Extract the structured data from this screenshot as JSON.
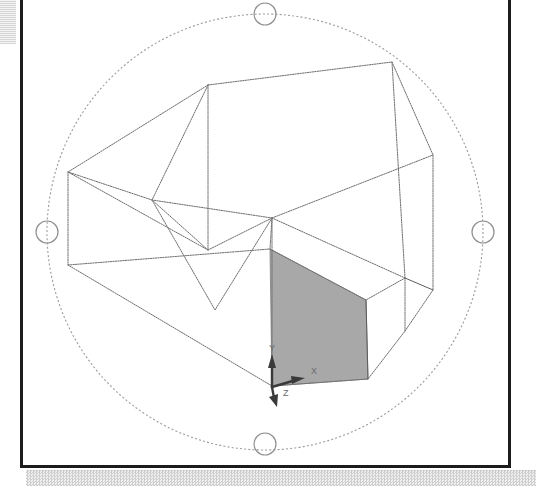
{
  "app": {
    "title": "3D Orbit Viewport",
    "background_color": "#ffffff",
    "frame_color": "#1c1c1c"
  },
  "viewport": {
    "name": "model-space-viewport",
    "width": 491,
    "height": 468,
    "shaded_face_color": "#a8a8a8",
    "wireframe_color": "#6e6e6e"
  },
  "orbit_tool": {
    "name": "3d-orbit-arcball",
    "ring_color": "#9a9a9a",
    "center_x": 265,
    "center_y": 232,
    "radius": 218,
    "handles": [
      {
        "id": "orbit-handle-top",
        "cx": 265,
        "cy": 14,
        "r": 11
      },
      {
        "id": "orbit-handle-bottom",
        "cx": 265,
        "cy": 444,
        "r": 11
      },
      {
        "id": "orbit-handle-left",
        "cx": 47,
        "cy": 232,
        "r": 11
      },
      {
        "id": "orbit-handle-right",
        "cx": 483,
        "cy": 232,
        "r": 11
      }
    ]
  },
  "ucs_gizmo": {
    "name": "ucs-axis-indicator",
    "origin_x": 272,
    "origin_y": 387,
    "axes": [
      {
        "label": "X",
        "label_x": 313,
        "label_y": 373,
        "tip_x": 302,
        "tip_y": 380
      },
      {
        "label": "Y",
        "label_x": 273,
        "label_y": 350,
        "tip_x": 272,
        "tip_y": 358
      },
      {
        "label": "Z",
        "label_x": 286,
        "label_y": 393,
        "tip_x": 276,
        "tip_y": 404
      }
    ]
  },
  "model": {
    "name": "wireframe-solid",
    "shaded_face": "270,249 366,300 368,379 272,386",
    "wire_polylines": [
      "208,85 392,62 433,155 433,290 405,331 368,379 272,386 68,265 68,172 208,85",
      "208,85 208,250 68,172",
      "208,250 272,218 272,386",
      "272,218 433,155",
      "272,218 405,278 405,331",
      "208,250 152,200 68,172",
      "152,200 272,218",
      "272,218 215,310 152,200",
      "68,265 270,249 366,300 405,278",
      "270,249 272,218",
      "366,300 368,379",
      "405,278 433,290",
      "208,85 152,200",
      "392,62 405,278"
    ]
  }
}
